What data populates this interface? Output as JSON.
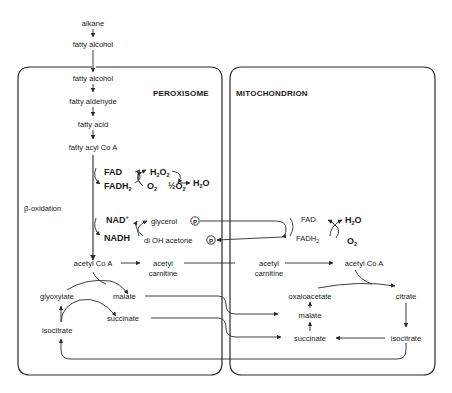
{
  "compartments": {
    "peroxisome": "PEROXISOME",
    "mitochondrion": "MITOCHONDRION"
  },
  "outside": {
    "alkane": "alkane",
    "fatty_alcohol": "fatty alcohol"
  },
  "peroxisome": {
    "fatty_alcohol": "fatty alcohol",
    "fatty_aldehyde": "fatty aldehyde",
    "fatty_acid": "fatty acid",
    "fatty_acyl_coa": "fatty acyl Co A",
    "beta_oxidation": "β-oxidation",
    "fad": "FAD",
    "fadh2": "FADH",
    "fadh2_sub": "2",
    "o2": "O",
    "o2_sub": "2",
    "h2o2": "H",
    "h2o2_sub1": "2",
    "h2o2_mid": "O",
    "h2o2_sub2": "2",
    "h2o": "H",
    "h2o_sub": "2",
    "h2o_end": "O",
    "half_o2": "½O",
    "half_o2_sub": "2",
    "nad": "NAD",
    "nad_sup": "+",
    "nadh": "NADH",
    "glycerol": "glycerol",
    "di_oh_acetone": "di OH acetone",
    "phosphate": "P",
    "acetyl_coa": "acetyl Co A",
    "acetyl_carnitine_1": "acetyl",
    "acetyl_carnitine_2": "carnitine",
    "glyoxylate": "glyoxylate",
    "malate": "malate",
    "succinate": "succinate",
    "isocitrate": "isocitrate"
  },
  "mitochondrion": {
    "fad": "FAD",
    "fadh2": "FADH",
    "fadh2_sub": "2",
    "h2o": "H",
    "h2o_sub": "2",
    "h2o_end": "O",
    "o2": "O",
    "o2_sub": "2",
    "acetyl_carnitine_1": "acetyl",
    "acetyl_carnitine_2": "carnitine",
    "acetyl_coa": "acetyl Co A",
    "oxaloacetate": "oxaloacetate",
    "citrate": "citrate",
    "malate": "malate",
    "succinate": "succinate",
    "isocitrate": "isocitrate"
  }
}
